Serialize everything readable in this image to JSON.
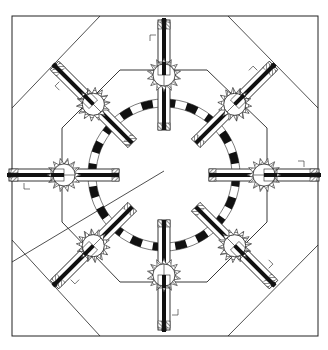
{
  "diagram": {
    "title": "",
    "colors": {
      "stroke": "#222222",
      "fill": "#ffffff",
      "dark": "#111111"
    },
    "center": [
      164,
      175
    ],
    "frame": {
      "x": 12,
      "y": 16,
      "w": 306,
      "h": 320
    },
    "octagon": [
      [
        120,
        70
      ],
      [
        207,
        70
      ],
      [
        267,
        128
      ],
      [
        267,
        222
      ],
      [
        207,
        282
      ],
      [
        120,
        282
      ],
      [
        62,
        222
      ],
      [
        62,
        128
      ]
    ],
    "ring": {
      "r": 72,
      "segments": 40
    },
    "arms": [
      {
        "label": "arm-n",
        "angle": -90
      },
      {
        "label": "arm-ne",
        "angle": -45
      },
      {
        "label": "arm-e",
        "angle": 0
      },
      {
        "label": "arm-se",
        "angle": 45
      },
      {
        "label": "arm-s",
        "angle": 90
      },
      {
        "label": "arm-sw",
        "angle": 135
      },
      {
        "label": "arm-w",
        "angle": 180
      },
      {
        "label": "arm-nw",
        "angle": -135
      }
    ]
  }
}
